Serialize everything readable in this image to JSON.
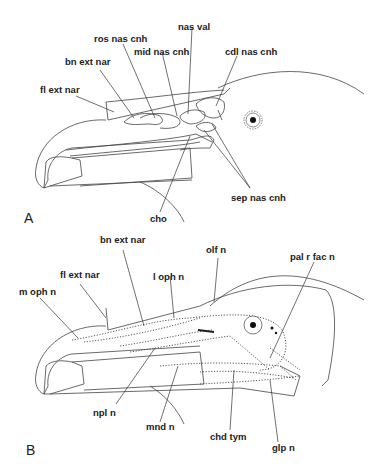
{
  "figure": {
    "panel_a": {
      "letter": "A",
      "labels": {
        "ros_nas_cnh": "ros nas cnh",
        "nas_val": "nas val",
        "mid_nas_cnh": "mid nas cnh",
        "cdl_nas_cnh": "cdl nas cnh",
        "bn_ext_nar": "bn ext nar",
        "fl_ext_nar": "fl ext nar",
        "sep_nas_cnh": "sep nas cnh",
        "cho": "cho"
      }
    },
    "panel_b": {
      "letter": "B",
      "labels": {
        "bn_ext_nar": "bn ext nar",
        "olf_n": "olf n",
        "pal_r_fac_n": "pal r fac n",
        "fl_ext_nar": "fl ext nar",
        "l_oph_n": "l oph n",
        "m_oph_n": "m oph n",
        "npl_n": "npl n",
        "mnd_n": "mnd n",
        "chd_tym": "chd tym",
        "glp_n": "glp n"
      }
    }
  }
}
